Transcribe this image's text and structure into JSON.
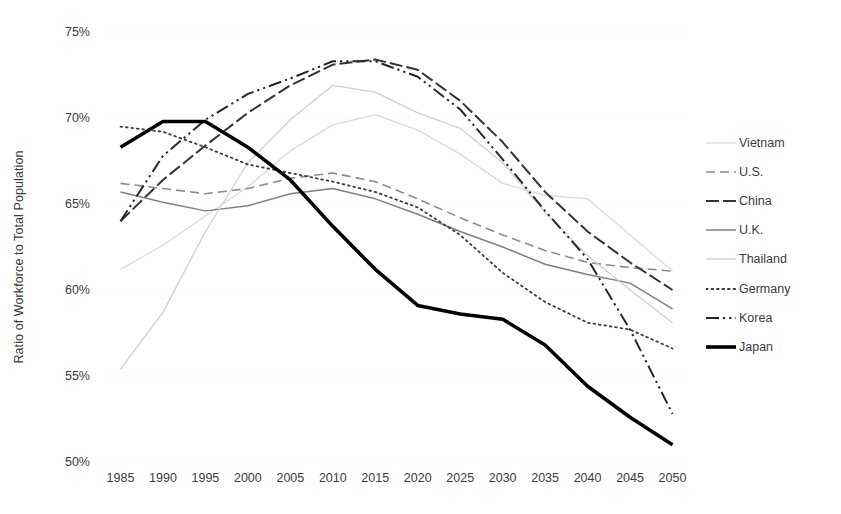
{
  "chart_data": {
    "type": "line",
    "title": "",
    "xlabel": "",
    "ylabel": "Ratio of Workforce to Total Population",
    "x": [
      1985,
      1990,
      1995,
      2000,
      2005,
      2010,
      2015,
      2020,
      2025,
      2030,
      2035,
      2040,
      2045,
      2050
    ],
    "xlim": [
      1985,
      2050
    ],
    "ylim": [
      50,
      75
    ],
    "ytick_labels": [
      "75%",
      "70%",
      "65%",
      "60%",
      "55%",
      "50%"
    ],
    "ytick_values": [
      75,
      70,
      65,
      60,
      55,
      50
    ],
    "xtick_labels": [
      "1985",
      "1990",
      "1995",
      "2000",
      "2005",
      "2010",
      "2015",
      "2020",
      "2025",
      "2030",
      "2035",
      "2040",
      "2045",
      "2050"
    ],
    "grid": false,
    "legend_position": "right",
    "series": [
      {
        "name": "Vietnam",
        "style": "solid",
        "color": "#d9d9d9",
        "width": 1.3,
        "values": [
          61.2,
          62.6,
          64.3,
          66.0,
          68.1,
          69.6,
          70.2,
          69.3,
          67.9,
          66.2,
          65.5,
          65.3,
          63.2,
          61.1
        ]
      },
      {
        "name": "U.S.",
        "style": "dashed",
        "color": "#8c8c8c",
        "width": 1.6,
        "values": [
          66.2,
          65.9,
          65.6,
          65.9,
          66.5,
          66.8,
          66.3,
          65.3,
          64.2,
          63.2,
          62.3,
          61.6,
          61.3,
          61.1
        ]
      },
      {
        "name": "China",
        "style": "longdash",
        "color": "#333333",
        "width": 2.0,
        "values": [
          64.0,
          66.4,
          68.4,
          70.3,
          71.9,
          73.1,
          73.4,
          72.8,
          71.0,
          68.6,
          65.7,
          63.4,
          61.6,
          60.0
        ]
      },
      {
        "name": "U.K.",
        "style": "solid",
        "color": "#7f7f7f",
        "width": 1.5,
        "values": [
          65.7,
          65.1,
          64.6,
          64.9,
          65.6,
          65.9,
          65.3,
          64.4,
          63.4,
          62.5,
          61.5,
          60.9,
          60.4,
          58.9
        ]
      },
      {
        "name": "Thailand",
        "style": "solid",
        "color": "#cfcfcf",
        "width": 1.3,
        "values": [
          55.4,
          58.7,
          63.4,
          67.4,
          69.9,
          71.9,
          71.5,
          70.3,
          69.4,
          67.4,
          64.5,
          62.0,
          60.0,
          58.1
        ]
      },
      {
        "name": "Germany",
        "style": "dotted",
        "color": "#3b3b3b",
        "width": 1.8,
        "values": [
          69.5,
          69.2,
          68.3,
          67.3,
          66.8,
          66.3,
          65.7,
          64.8,
          63.2,
          61.0,
          59.3,
          58.1,
          57.7,
          56.6
        ]
      },
      {
        "name": "Korea",
        "style": "dashdot",
        "color": "#262626",
        "width": 2.0,
        "values": [
          64.0,
          67.8,
          69.9,
          71.4,
          72.3,
          73.3,
          73.3,
          72.4,
          70.5,
          67.6,
          64.6,
          61.8,
          57.7,
          52.8
        ]
      },
      {
        "name": "Japan",
        "style": "solid",
        "color": "#000000",
        "width": 3.6,
        "values": [
          68.3,
          69.8,
          69.8,
          68.3,
          66.4,
          63.7,
          61.2,
          59.1,
          58.6,
          58.3,
          56.8,
          54.4,
          52.6,
          51.0
        ]
      }
    ]
  },
  "legend": {
    "items": [
      {
        "label": "Vietnam"
      },
      {
        "label": "U.S."
      },
      {
        "label": "China"
      },
      {
        "label": "U.K."
      },
      {
        "label": "Thailand"
      },
      {
        "label": "Germany"
      },
      {
        "label": "Korea"
      },
      {
        "label": "Japan"
      }
    ]
  }
}
